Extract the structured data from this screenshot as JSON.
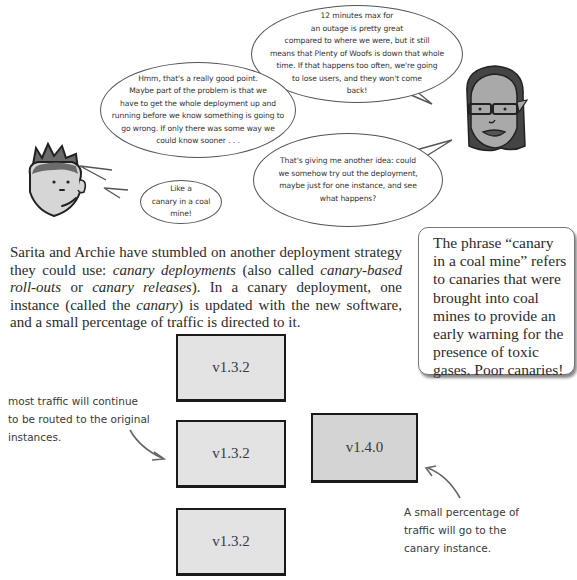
{
  "bubbles": {
    "sarita_top": {
      "lines": [
        "12 minutes max for",
        "an outage is pretty great",
        "compared to where we were, but it still",
        "means that Plenty of Woofs is down that whole",
        "time. If that happens too often, we're going",
        "to lose users, and they won't come",
        "back!"
      ]
    },
    "archie_hmm": {
      "lines": [
        "Hmm, that's a really good point.",
        "Maybe part of the problem is that we",
        "have to get the whole deployment up and",
        "running before we know something is going to",
        "go wrong. If only there was some way we",
        "could know sooner . . ."
      ]
    },
    "sarita_idea": {
      "lines": [
        "That's giving me another idea: could",
        "we somehow try out the deployment,",
        "maybe just for one instance, and see",
        "what happens?"
      ]
    },
    "archie_canary": {
      "lines": [
        "Like a",
        "canary in a coal",
        "mine!"
      ]
    }
  },
  "characters": {
    "archie": "archie-face",
    "sarita": "sarita-face"
  },
  "paragraph": {
    "p1": "Sarita and Archie have stumbled on another deployment strategy they could use: ",
    "term1": "canary deployments",
    "p2": " (also called ",
    "term2": "canary-based roll-outs",
    "p3": " or ",
    "term3": "canary releases",
    "p4": "). In a canary deployment, one instance (called the ",
    "term4": "canary",
    "p5": ") is updated with the new software, and a small percentage of traffic is directed to it."
  },
  "sidebar": {
    "text": "The phrase “canary in a coal mine” refers to canaries that were brought into coal mines to provide an early warning for the presence of toxic gases. Poor canaries!"
  },
  "diagram": {
    "instances": [
      {
        "label": "v1.3.2",
        "type": "original"
      },
      {
        "label": "v1.3.2",
        "type": "original"
      },
      {
        "label": "v1.3.2",
        "type": "original"
      },
      {
        "label": "v1.4.0",
        "type": "canary"
      }
    ],
    "annotations": {
      "left": [
        "most traffic will continue",
        "to be routed to the original",
        "instances."
      ],
      "right": [
        "A small percentage of",
        "traffic will go to the",
        "canary instance."
      ]
    }
  }
}
